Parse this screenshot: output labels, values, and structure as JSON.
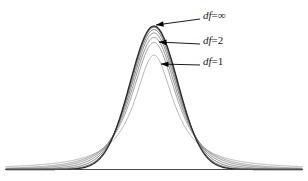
{
  "figure": {
    "title": "",
    "background_color": "#ffffff",
    "baseline_color": "#4a4a4a",
    "width": 308,
    "height": 181
  },
  "chart_data": {
    "type": "line",
    "title": "",
    "subtitle": "",
    "xlabel": "",
    "ylabel": "",
    "xlim": [
      -6.2,
      6.2
    ],
    "ylim": [
      0,
      0.42
    ],
    "grid": false,
    "legend_position": "inline-annotations",
    "x": [
      -6.2,
      -5.8,
      -5.4,
      -5.0,
      -4.6,
      -4.2,
      -3.8,
      -3.4,
      -3.0,
      -2.6,
      -2.2,
      -1.8,
      -1.4,
      -1.0,
      -0.6,
      -0.2,
      0.2,
      0.6,
      1.0,
      1.4,
      1.8,
      2.2,
      2.6,
      3.0,
      3.4,
      3.8,
      4.2,
      4.6,
      5.0,
      5.4,
      5.8,
      6.2
    ],
    "series": [
      {
        "name": "df=1",
        "df": 1,
        "peak": 0.3183,
        "color": "#b4b4b4",
        "stroke_width": 1.0,
        "labeled": true
      },
      {
        "name": "df=2",
        "df": 2,
        "peak": 0.3536,
        "color": "#a0a0a0",
        "stroke_width": 1.0,
        "labeled": true
      },
      {
        "name": "df=3",
        "df": 3,
        "peak": 0.3676,
        "color": "#949494",
        "stroke_width": 1.0,
        "labeled": false
      },
      {
        "name": "df=5",
        "df": 5,
        "peak": 0.3796,
        "color": "#888888",
        "stroke_width": 1.0,
        "labeled": false
      },
      {
        "name": "df=10",
        "df": 10,
        "peak": 0.3891,
        "color": "#777777",
        "stroke_width": 1.0,
        "labeled": false
      },
      {
        "name": "df=30",
        "df": 30,
        "peak": 0.3956,
        "color": "#646464",
        "stroke_width": 1.0,
        "labeled": false
      },
      {
        "name": "df=∞",
        "df": 100000,
        "peak": 0.3989,
        "color": "#2b2b2b",
        "stroke_width": 1.3,
        "labeled": true
      }
    ]
  },
  "annotations": [
    {
      "id": "annot-df-infinity",
      "variable": "df",
      "equals": "=",
      "value": "∞",
      "full_text": "df=∞",
      "label_x": 203,
      "label_y": 9,
      "leader_from_x": 200,
      "leader_from_y": 19,
      "leader_to_x": 156,
      "leader_to_y": 25
    },
    {
      "id": "annot-df-2",
      "variable": "df",
      "equals": "=",
      "value": "2",
      "full_text": "df=2",
      "label_x": 203,
      "label_y": 34,
      "leader_from_x": 200,
      "leader_from_y": 44,
      "leader_to_x": 159,
      "leader_to_y": 42
    },
    {
      "id": "annot-df-1",
      "variable": "df",
      "equals": "=",
      "value": "1",
      "full_text": "df=1",
      "label_x": 203,
      "label_y": 55,
      "leader_from_x": 200,
      "leader_from_y": 65,
      "leader_to_x": 161,
      "leader_to_y": 64
    }
  ]
}
